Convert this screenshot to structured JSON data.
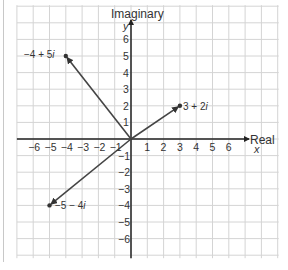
{
  "chart_data": {
    "type": "scatter",
    "title": "",
    "xlabel": "Real",
    "ylabel": "Imaginary",
    "x_axis_letter": "x",
    "y_axis_letter": "y",
    "xlim": [
      -7,
      9
    ],
    "ylim": [
      -7,
      8
    ],
    "grid": true,
    "x_ticks": [
      "-6",
      "-5",
      "-4",
      "-3",
      "-2",
      "-1",
      "1",
      "2",
      "3",
      "4",
      "5",
      "6"
    ],
    "y_ticks": [
      "6",
      "5",
      "4",
      "3",
      "2",
      "1",
      "-1",
      "-2",
      "-3",
      "-4",
      "-5",
      "-6"
    ],
    "points": [
      {
        "label": "−4 + 5i",
        "re": -4,
        "im": 5
      },
      {
        "label": "3 + 2i",
        "re": 3,
        "im": 2
      },
      {
        "label": "−5 − 4i",
        "re": -5,
        "im": -4
      }
    ],
    "vectors_from_origin": true
  },
  "labels": {
    "imaginary_axis": "Imaginary",
    "real_axis": "Real",
    "x_letter": "x",
    "y_letter": "y",
    "p1_text": "−4 + 5",
    "p1_i": "i",
    "p2_text": "3 + 2",
    "p2_i": "i",
    "p3_text": "−5 − 4",
    "p3_i": "i"
  }
}
